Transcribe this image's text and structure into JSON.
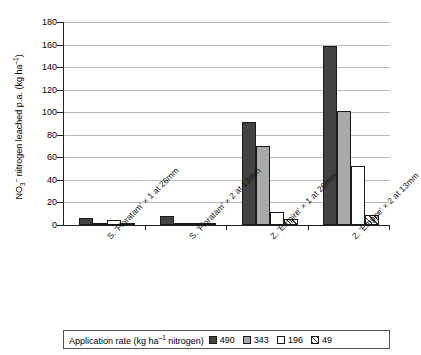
{
  "chart_data": {
    "type": "bar",
    "title": "",
    "xlabel": "",
    "ylabel": "NO3- nitrogen leached p.a.  (kg ha-1)",
    "ylim": [
      0,
      180
    ],
    "yticks": [
      0,
      20,
      40,
      60,
      80,
      100,
      120,
      140,
      160,
      180
    ],
    "grid": true,
    "legend_position": "bottom",
    "legend_title": "Application rate (kg ha-1 nitrogen)",
    "categories": [
      "S. 'Floratam' × 1 at 26mm",
      "S. 'Floratam' × 2 at 13mm",
      "Z. 'Empire' × 1 at 26mm",
      "Z. 'Empire' × 2 at 13mm"
    ],
    "series": [
      {
        "name": "490",
        "color": "#434343",
        "fill": "solid-dark",
        "values": [
          6.5,
          7.8,
          91,
          159
        ]
      },
      {
        "name": "343",
        "color": "#a9a9a9",
        "fill": "solid-gray",
        "values": [
          0.6,
          2.2,
          70,
          101
        ]
      },
      {
        "name": "196",
        "color": "#ffffff",
        "fill": "white",
        "values": [
          4.2,
          1.8,
          11.5,
          52
        ]
      },
      {
        "name": "49",
        "color": "#3a3a3a",
        "fill": "hatched",
        "values": [
          0.8,
          1.2,
          5,
          8.5
        ]
      }
    ]
  },
  "axis": {
    "y_title_parts": {
      "prefix": "NO",
      "sub": "3",
      "sup_charge": "–",
      "mid": " nitrogen leached p.a.  (kg ha",
      "sup_exp": "–1",
      "suffix": ")"
    },
    "tick_labels": [
      "180",
      "160",
      "140",
      "120",
      "100",
      "80",
      "60",
      "40",
      "20",
      "0"
    ]
  },
  "legend": {
    "title_prefix": "Application rate (kg ha",
    "title_sup": "–1",
    "title_suffix": " nitrogen)",
    "items": [
      {
        "label": "490",
        "swatch": "solid-dark"
      },
      {
        "label": "343",
        "swatch": "solid-gray"
      },
      {
        "label": "196",
        "swatch": "white"
      },
      {
        "label": "49",
        "swatch": "hatched"
      }
    ]
  }
}
